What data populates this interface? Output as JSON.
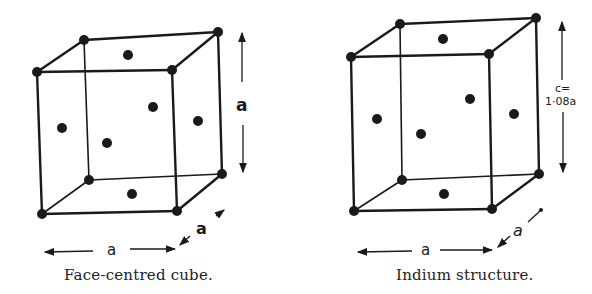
{
  "figures": [
    {
      "id": "fcc",
      "caption": "Face-centred cube.",
      "dimension_labels": {
        "width": "a",
        "depth": "a",
        "height": "a"
      }
    },
    {
      "id": "indium",
      "caption": "Indium structure.",
      "dimension_labels": {
        "width": "a",
        "depth": "a",
        "height_line1": "c=",
        "height_line2": "1·08a"
      }
    }
  ],
  "colors": {
    "ink": "#1a1a1a",
    "background": "#ffffff"
  }
}
